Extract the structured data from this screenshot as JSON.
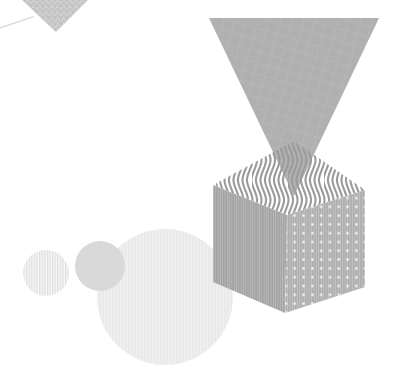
{
  "scene": {
    "description": "Abstract geometric monochrome composition: grainy corner triangle, large crosshatched triangle pointing down into a patterned isometric cube, with three pastel circles at lower left",
    "shapes": [
      "grain-corner-triangle",
      "accent-line",
      "large-triangle",
      "cube-top-face-wavy",
      "cube-left-face-striped",
      "cube-right-face-dotted",
      "circle-large",
      "circle-medium",
      "circle-small-striped"
    ],
    "colors": {
      "background": "#ffffff",
      "accent_line": "#d4d4d4",
      "grain_base": "#c9c9c9",
      "grain_dark": "#bcbcbc",
      "grain_light": "#dadada",
      "large_triangle": "#b0b0b0",
      "large_triangle_grid": "#bdbdbd",
      "cube_top_stripe": "#9b9b9b",
      "cube_left_stripe": "#a2a2a2",
      "cube_left_gap": "#bdbdbd",
      "cube_right_stripe": "#aeaeae",
      "cube_right_gap": "#c3c3c3",
      "cube_dot": "#ffffff",
      "circle_large_base": "#efefef",
      "circle_large_stripe": "#e9e9e9",
      "circle_medium": "#d9d9d9",
      "circle_small_base": "#f8f8f8",
      "circle_small_stripe": "#dedede"
    }
  }
}
